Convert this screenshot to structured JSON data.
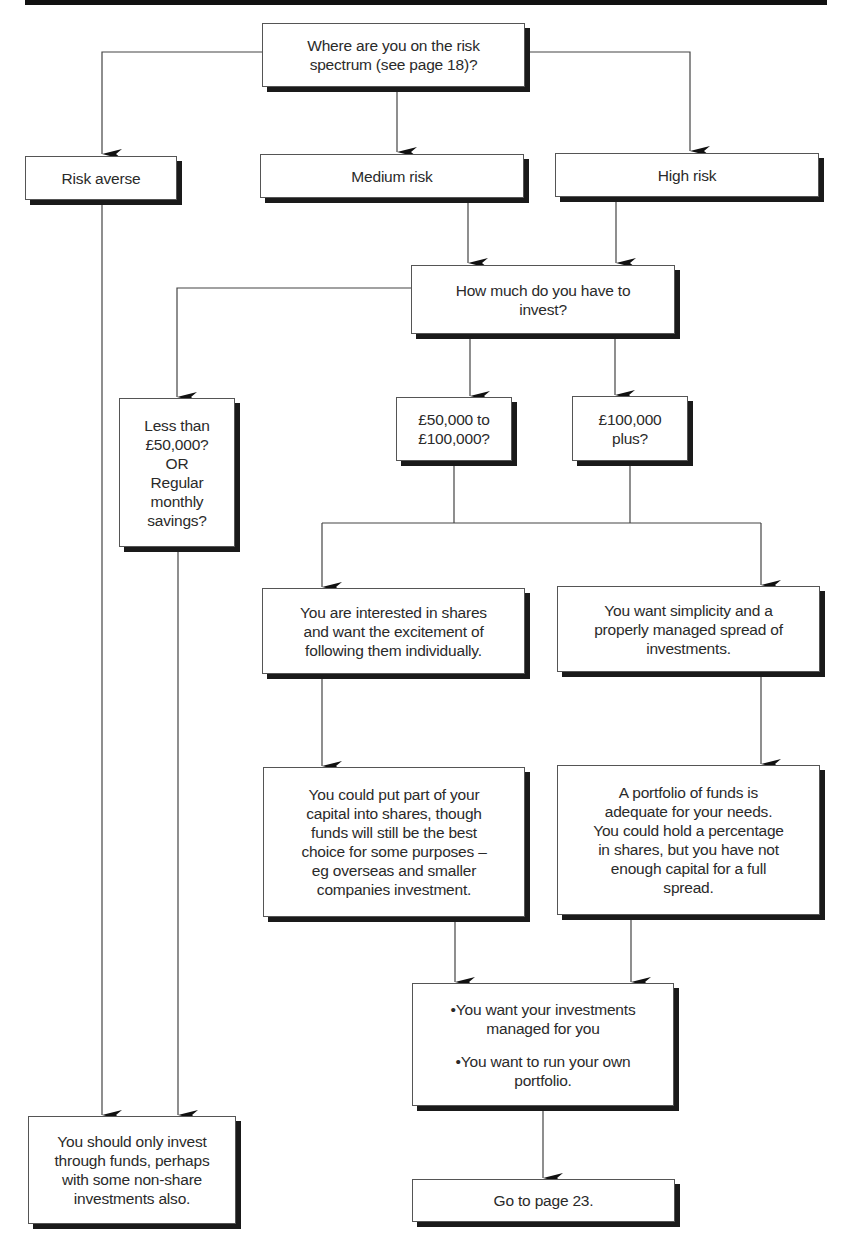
{
  "flowchart": {
    "start": "Where are you on the risk\nspectrum (see page 18)?",
    "risk_levels": [
      "Risk averse",
      "Medium risk",
      "High risk"
    ],
    "amount_question": "How much do you have to\ninvest?",
    "amounts": [
      "Less than\n£50,000?\nOR\nRegular\nmonthly\nsavings?",
      "£50,000 to\n£100,000?",
      "£100,000\nplus?"
    ],
    "preferences": [
      "You are interested in shares\nand want the excitement of\nfollowing them individually.",
      "You want simplicity and a\nproperly managed spread of\ninvestments."
    ],
    "advice": [
      "You could put part of your\ncapital into shares, though\nfunds will still be the best\nchoice for some purposes –\neg overseas and smaller\ncompanies investment.",
      "A portfolio of funds is\nadequate for your needs.\nYou could hold a percentage\nin shares, but you have not\nenough capital for a full\nspread."
    ],
    "options": [
      "•You want your investments\nmanaged for you",
      "•You want to run your own\nportfolio."
    ],
    "funds_only": "You should only invest\nthrough funds, perhaps\nwith some non-share\ninvestments also.",
    "goto": "Go to page 23."
  }
}
